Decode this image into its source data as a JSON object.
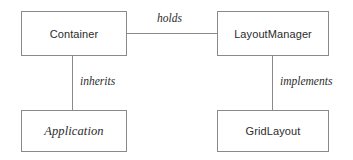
{
  "diagram": {
    "type": "uml-class-diagram",
    "background_color": "#ffffff",
    "border_color": "#8a8a8a",
    "text_color": "#2b2b2b",
    "nodes": [
      {
        "id": "container",
        "label": "Container",
        "style": "plain",
        "x": 21,
        "y": 11,
        "width": 106,
        "height": 45
      },
      {
        "id": "layoutmanager",
        "label": "LayoutManager",
        "style": "plain",
        "x": 217,
        "y": 11,
        "width": 112,
        "height": 45
      },
      {
        "id": "application",
        "label": "Application",
        "style": "italic",
        "x": 21,
        "y": 110,
        "width": 106,
        "height": 42
      },
      {
        "id": "gridlayout",
        "label": "GridLayout",
        "style": "plain",
        "x": 217,
        "y": 110,
        "width": 112,
        "height": 42
      }
    ],
    "edges": [
      {
        "id": "holds",
        "label": "holds",
        "from": "container",
        "to": "layoutmanager",
        "orientation": "horizontal"
      },
      {
        "id": "inherits",
        "label": "inherits",
        "from": "container",
        "to": "application",
        "orientation": "vertical"
      },
      {
        "id": "implements",
        "label": "implements",
        "from": "layoutmanager",
        "to": "gridlayout",
        "orientation": "vertical"
      }
    ]
  }
}
